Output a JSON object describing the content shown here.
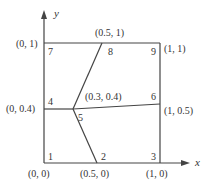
{
  "diagram": {
    "type": "finite-element-mesh",
    "axes": {
      "x_label": "x",
      "y_label": "y"
    },
    "colors": {
      "line": "#444444",
      "text": "#333333",
      "background": "#ffffff"
    },
    "nodes": [
      {
        "id": "1",
        "coord": "(0, 0)",
        "x": 0,
        "y": 0
      },
      {
        "id": "2",
        "coord": "(0.5, 0)",
        "x": 0.5,
        "y": 0
      },
      {
        "id": "3",
        "coord": "(1, 0)",
        "x": 1,
        "y": 0
      },
      {
        "id": "4",
        "coord": "(0, 0.4)",
        "x": 0,
        "y": 0.4
      },
      {
        "id": "5",
        "coord": "(0.3, 0.4)",
        "x": 0.3,
        "y": 0.4
      },
      {
        "id": "6",
        "coord": "(1, 0.5)",
        "x": 1,
        "y": 0.5
      },
      {
        "id": "7",
        "coord": "(0, 1)",
        "x": 0,
        "y": 1
      },
      {
        "id": "8",
        "coord": "(0.5, 1)",
        "x": 0.5,
        "y": 1
      },
      {
        "id": "9",
        "coord": "(1, 1)",
        "x": 1,
        "y": 1
      }
    ],
    "elements": [
      [
        "1",
        "2",
        "5",
        "4"
      ],
      [
        "2",
        "3",
        "6",
        "5"
      ],
      [
        "4",
        "5",
        "8",
        "7"
      ],
      [
        "5",
        "6",
        "9",
        "8"
      ]
    ]
  }
}
